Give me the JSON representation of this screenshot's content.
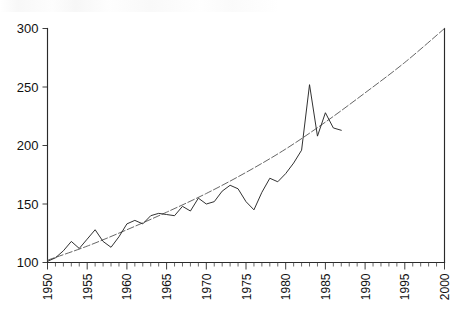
{
  "chart_data": {
    "type": "line",
    "title": "",
    "subtitle": "",
    "xlabel": "",
    "ylabel": "",
    "xlim": [
      1950,
      2000
    ],
    "ylim": [
      100,
      300
    ],
    "grid": false,
    "legend": "none",
    "x_tick_labels": [
      "1950",
      "1955",
      "1960",
      "1965",
      "1970",
      "1975",
      "1980",
      "1985",
      "1990",
      "1995",
      "2000"
    ],
    "x_tick_values": [
      1950,
      1955,
      1960,
      1965,
      1970,
      1975,
      1980,
      1985,
      1990,
      1995,
      2000
    ],
    "x_minor_tick_step": 1,
    "y_tick_labels": [
      "100",
      "150",
      "200",
      "250",
      "300"
    ],
    "y_tick_values": [
      100,
      150,
      200,
      250,
      300
    ],
    "series": [
      {
        "name": "observed",
        "style": "jagged-solid",
        "x": [
          1950,
          1951,
          1952,
          1953,
          1954,
          1955,
          1956,
          1957,
          1958,
          1959,
          1960,
          1961,
          1962,
          1963,
          1964,
          1965,
          1966,
          1967,
          1968,
          1969,
          1970,
          1971,
          1972,
          1973,
          1974,
          1975,
          1976,
          1977,
          1978,
          1979,
          1980,
          1981,
          1982,
          1983,
          1984,
          1985,
          1986,
          1987
        ],
        "values": [
          101,
          104,
          110,
          118,
          112,
          120,
          128,
          118,
          113,
          122,
          133,
          136,
          133,
          140,
          142,
          141,
          140,
          148,
          144,
          155,
          150,
          152,
          161,
          166,
          163,
          152,
          145,
          160,
          172,
          169,
          176,
          185,
          196,
          252,
          208,
          228,
          215,
          213
        ]
      },
      {
        "name": "fitted trend",
        "style": "smooth-dashed",
        "x": [
          1950,
          1955,
          1960,
          1965,
          1970,
          1975,
          1980,
          1985,
          1990,
          1995,
          2000
        ],
        "values": [
          102,
          114,
          128,
          143,
          159,
          177,
          197,
          220,
          245,
          271,
          300
        ]
      }
    ]
  },
  "axes": {
    "frame": "bottom-left-right",
    "tick_direction": "outward",
    "x_label_rotation": 90
  }
}
